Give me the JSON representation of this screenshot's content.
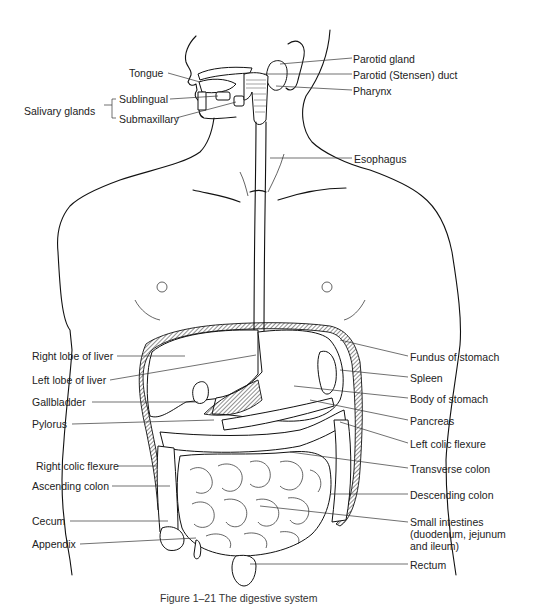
{
  "figure": {
    "title": "The digestive system",
    "caption": "Figure 1–21  The digestive system"
  },
  "labels": {
    "left": {
      "tongue": "Tongue",
      "salivary_glands": "Salivary glands",
      "sublingual": "Sublingual",
      "submaxillary": "Submaxillary",
      "right_lobe_liver": "Right lobe of liver",
      "left_lobe_liver": "Left lobe of liver",
      "gallbladder": "Gallbladder",
      "pylorus": "Pylorus",
      "right_colic_flexure": "Right colic flexure",
      "ascending_colon": "Ascending colon",
      "cecum": "Cecum",
      "appendix": "Appendix"
    },
    "right": {
      "parotid_gland": "Parotid gland",
      "parotid_duct": "Parotid (Stensen) duct",
      "pharynx": "Pharynx",
      "esophagus": "Esophagus",
      "fundus_stomach": "Fundus of stomach",
      "spleen": "Spleen",
      "body_stomach": "Body of stomach",
      "pancreas": "Pancreas",
      "left_colic_flexure": "Left colic flexure",
      "transverse_colon": "Transverse colon",
      "descending_colon": "Descending colon",
      "small_intestines": "Small intestines (duodenum, jejunum and ileum)",
      "rectum": "Rectum"
    }
  }
}
